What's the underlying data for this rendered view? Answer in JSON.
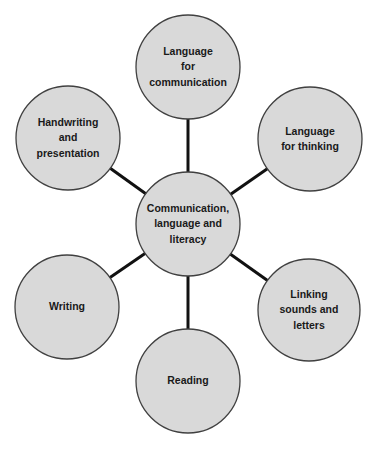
{
  "diagram": {
    "type": "mind-map",
    "colors": {
      "node_fill": "#d9d9d9",
      "node_stroke": "#404040",
      "connector": "#111111",
      "text": "#1a1a1a"
    },
    "center": {
      "label": "Communication,\nlanguage and\nliteracy",
      "cx": 188,
      "cy": 224,
      "r": 52
    },
    "nodes": [
      {
        "label": "Language\nfor\ncommunication",
        "cx": 188,
        "cy": 67,
        "r": 52
      },
      {
        "label": "Language\nfor thinking",
        "cx": 310,
        "cy": 139,
        "r": 52
      },
      {
        "label": "Linking\nsounds and\nletters",
        "cx": 309,
        "cy": 310,
        "r": 51
      },
      {
        "label": "Reading",
        "cx": 188,
        "cy": 381,
        "r": 52
      },
      {
        "label": "Writing",
        "cx": 67,
        "cy": 307,
        "r": 52
      },
      {
        "label": "Handwriting\nand\npresentation",
        "cx": 68,
        "cy": 138,
        "r": 52
      }
    ]
  }
}
